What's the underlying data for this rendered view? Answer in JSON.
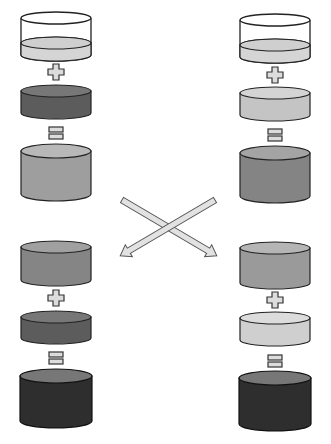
{
  "colors": {
    "stroke": "#222222",
    "empty_glass": "#ffffff",
    "very_light": "#d9d9d9",
    "light": "#c4c4c4",
    "medium": "#a3a3a3",
    "medium_dark": "#8a8a8a",
    "dark": "#5c5c5c",
    "darkest": "#2e2e2e",
    "symbol_fill": "#dcdcdc",
    "arrow_fill": "#e2e2e2"
  },
  "columns": [
    {
      "id": "left",
      "top_stage": {
        "beaker": "partially filled with light liquid",
        "plus": "+",
        "added": "dark disk",
        "equals": "=",
        "result": "medium gray cylinder"
      },
      "bottom_stage": {
        "start": "medium-dark cylinder (from right)",
        "plus": "+",
        "added": "dark disk",
        "equals": "=",
        "result": "darkest cylinder"
      }
    },
    {
      "id": "right",
      "top_stage": {
        "beaker": "partially filled with light liquid",
        "plus": "+",
        "added": "light disk",
        "equals": "=",
        "result": "medium-dark cylinder"
      },
      "bottom_stage": {
        "start": "medium cylinder (from left)",
        "plus": "+",
        "added": "light disk",
        "equals": "=",
        "result": "darkest cylinder"
      }
    }
  ],
  "arrows": [
    "left-result to right-bottom",
    "right-result to left-bottom"
  ]
}
